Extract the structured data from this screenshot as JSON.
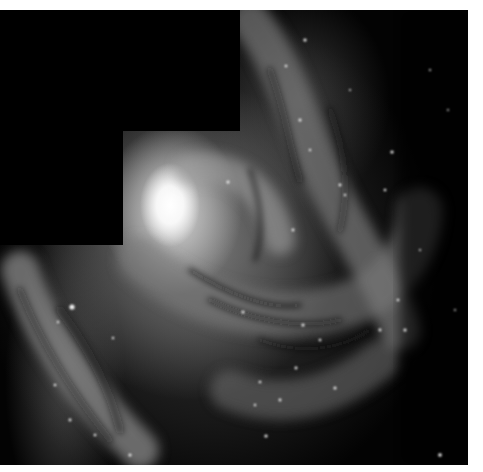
{
  "image": {
    "subject": "spiral galaxy",
    "style": "grayscale astronomical photograph",
    "frame": {
      "left": 0,
      "top": 10,
      "width": 468,
      "height": 455
    },
    "mask_steps": [
      {
        "left": 0,
        "top": 0,
        "width": 240,
        "height": 121
      },
      {
        "left": 0,
        "top": 121,
        "width": 123,
        "height": 114
      }
    ],
    "nucleus_center": [
      170,
      195
    ],
    "colors": {
      "background": "#030303",
      "margin": "#ffffff",
      "core": "#ffffff",
      "arm": "#8a8a8a",
      "dust": "#1a1a1a",
      "star": "#f5f5f5"
    }
  }
}
